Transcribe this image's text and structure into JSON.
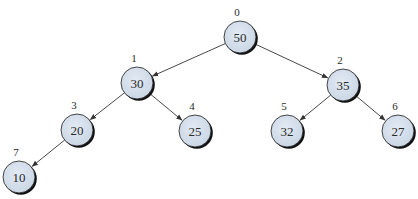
{
  "diagram": {
    "type": "binary-heap-tree",
    "colors": {
      "node_fill": "#d4deea",
      "node_stroke": "#1a1a1a",
      "node_shadow": "#111111",
      "edge": "#333333",
      "text": "#2a2a2a"
    },
    "nodes": [
      {
        "index": "0",
        "value": "50",
        "cx": 240,
        "cy": 37
      },
      {
        "index": "1",
        "value": "30",
        "cx": 137,
        "cy": 83
      },
      {
        "index": "2",
        "value": "35",
        "cx": 343,
        "cy": 85
      },
      {
        "index": "3",
        "value": "20",
        "cx": 77,
        "cy": 130
      },
      {
        "index": "4",
        "value": "25",
        "cx": 195,
        "cy": 131
      },
      {
        "index": "5",
        "value": "32",
        "cx": 287,
        "cy": 131
      },
      {
        "index": "6",
        "value": "27",
        "cx": 398,
        "cy": 131
      },
      {
        "index": "7",
        "value": "10",
        "cx": 19,
        "cy": 177
      }
    ],
    "edges": [
      {
        "from": 0,
        "to": 1
      },
      {
        "from": 0,
        "to": 2
      },
      {
        "from": 1,
        "to": 3
      },
      {
        "from": 1,
        "to": 4
      },
      {
        "from": 2,
        "to": 5
      },
      {
        "from": 2,
        "to": 6
      },
      {
        "from": 3,
        "to": 7
      }
    ]
  }
}
